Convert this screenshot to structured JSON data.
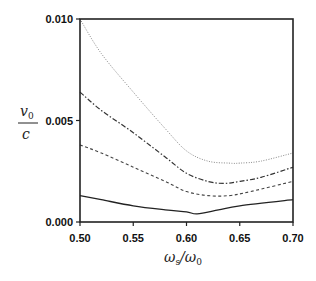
{
  "chart_data": {
    "type": "line",
    "title": "",
    "xlabel": "ωs/ω0",
    "ylabel": "v0/c",
    "xlim": [
      0.5,
      0.7
    ],
    "ylim": [
      0.0,
      0.01
    ],
    "xticks": [
      0.5,
      0.55,
      0.6,
      0.65,
      0.7
    ],
    "xtick_labels": [
      "0.50",
      "0.55",
      "0.60",
      "0.65",
      "0.70"
    ],
    "yticks": [
      0.0,
      0.005,
      0.01
    ],
    "ytick_labels": [
      "0.000",
      "0.005",
      "0.010"
    ],
    "grid": false,
    "legend": null,
    "series": [
      {
        "name": "dotted",
        "style": "dotted",
        "color": "#888888",
        "x": [
          0.5,
          0.52,
          0.55,
          0.58,
          0.6,
          0.62,
          0.64,
          0.65,
          0.67,
          0.7
        ],
        "values": [
          0.01,
          0.0083,
          0.0064,
          0.0046,
          0.0035,
          0.003,
          0.0029,
          0.0029,
          0.003,
          0.0034
        ]
      },
      {
        "name": "dash-dot",
        "style": "dashdot",
        "color": "#333333",
        "x": [
          0.5,
          0.52,
          0.55,
          0.58,
          0.6,
          0.62,
          0.635,
          0.65,
          0.67,
          0.7
        ],
        "values": [
          0.0064,
          0.0055,
          0.0044,
          0.0032,
          0.0024,
          0.002,
          0.0019,
          0.002,
          0.0022,
          0.0027
        ],
        "_note": "values approximate"
      },
      {
        "name": "dashed",
        "style": "dashed",
        "color": "#444444",
        "x": [
          0.5,
          0.52,
          0.55,
          0.58,
          0.6,
          0.62,
          0.64,
          0.66,
          0.7
        ],
        "values": [
          0.0038,
          0.0034,
          0.0027,
          0.002,
          0.0015,
          0.0013,
          0.0013,
          0.0015,
          0.002
        ]
      },
      {
        "name": "solid",
        "style": "solid",
        "color": "#222222",
        "x": [
          0.5,
          0.52,
          0.55,
          0.58,
          0.6,
          0.61,
          0.63,
          0.65,
          0.7
        ],
        "values": [
          0.0013,
          0.0011,
          0.0008,
          0.0006,
          0.0005,
          0.0004,
          0.0006,
          0.0008,
          0.0011
        ]
      }
    ]
  },
  "labels": {
    "y_num": "v",
    "y_num_sub": "0",
    "y_den": "c",
    "x_num": "ω",
    "x_num_sub": "s",
    "x_slash": "/",
    "x_den": "ω",
    "x_den_sub": "0"
  }
}
